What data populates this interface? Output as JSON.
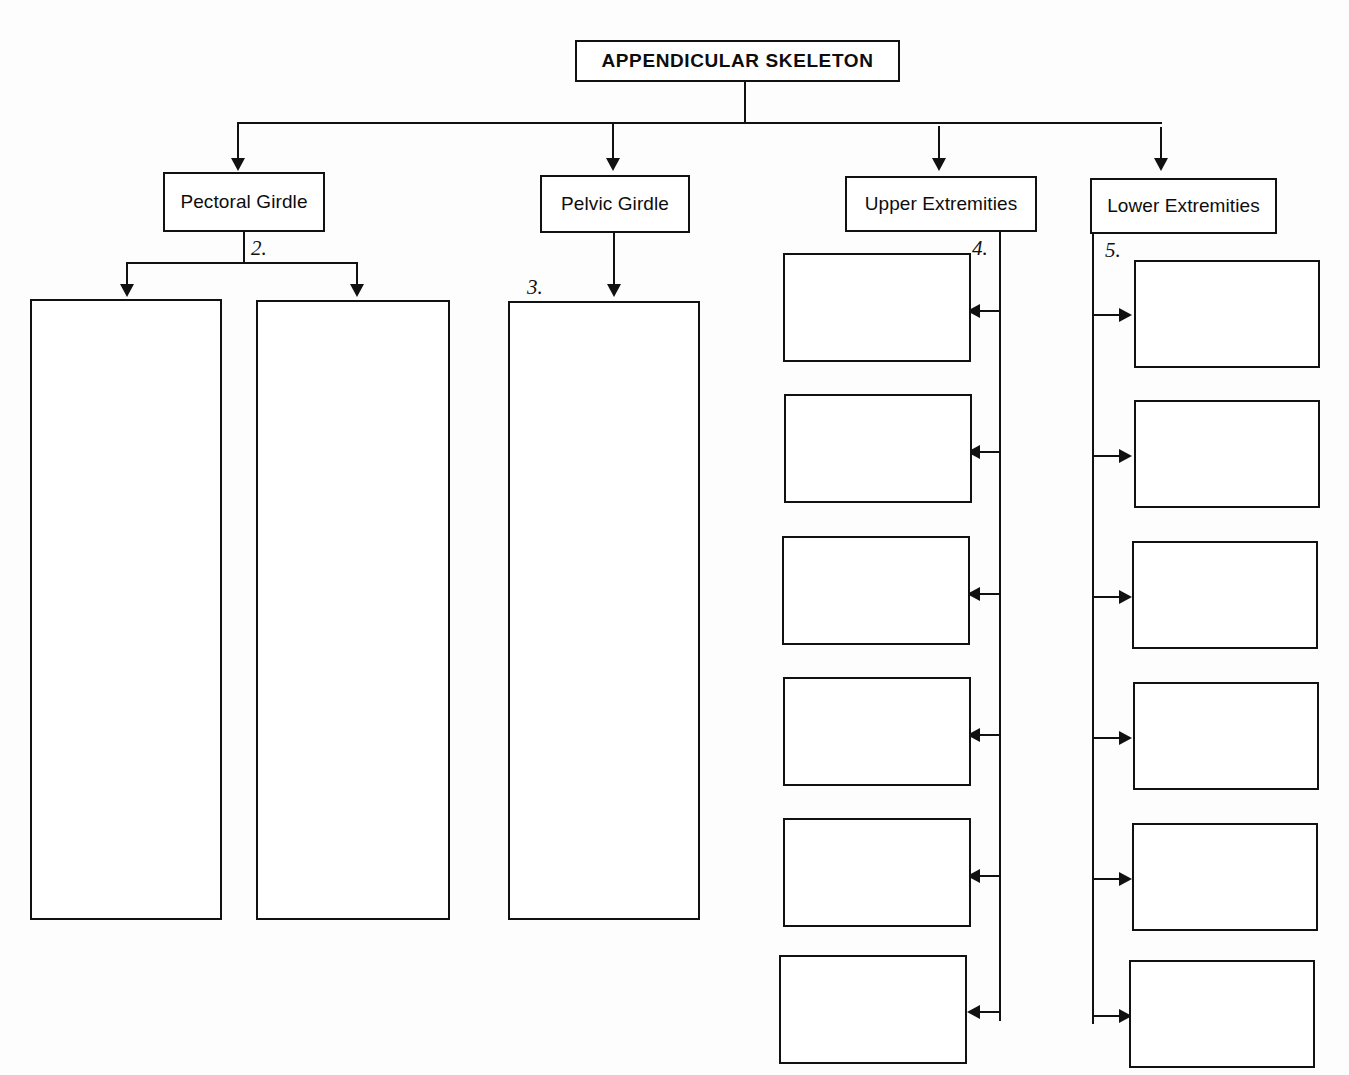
{
  "diagram": {
    "title_box": {
      "label": "APPENDICULAR SKELETON"
    },
    "branches": [
      {
        "id": "pectoral-girdle",
        "label": "Pectoral Girdle"
      },
      {
        "id": "pelvic-girdle",
        "label": "Pelvic Girdle"
      },
      {
        "id": "upper-extremities",
        "label": "Upper Extremities"
      },
      {
        "id": "lower-extremities",
        "label": "Lower Extremities"
      }
    ],
    "callouts": [
      {
        "id": "callout-2",
        "text": "2."
      },
      {
        "id": "callout-3",
        "text": "3."
      },
      {
        "id": "callout-4",
        "text": "4."
      },
      {
        "id": "callout-5",
        "text": "5."
      }
    ],
    "pectoral_blanks": [
      {
        "id": "pectoral-blank-1",
        "text": ""
      },
      {
        "id": "pectoral-blank-2",
        "text": ""
      }
    ],
    "pelvic_blanks": [
      {
        "id": "pelvic-blank-1",
        "text": ""
      }
    ],
    "upper_extremity_blanks": [
      {
        "id": "upper-blank-1",
        "text": ""
      },
      {
        "id": "upper-blank-2",
        "text": ""
      },
      {
        "id": "upper-blank-3",
        "text": ""
      },
      {
        "id": "upper-blank-4",
        "text": ""
      },
      {
        "id": "upper-blank-5",
        "text": ""
      },
      {
        "id": "upper-blank-6",
        "text": ""
      }
    ],
    "lower_extremity_blanks": [
      {
        "id": "lower-blank-1",
        "text": ""
      },
      {
        "id": "lower-blank-2",
        "text": ""
      },
      {
        "id": "lower-blank-3",
        "text": ""
      },
      {
        "id": "lower-blank-4",
        "text": ""
      },
      {
        "id": "lower-blank-5",
        "text": ""
      },
      {
        "id": "lower-blank-6",
        "text": ""
      }
    ],
    "colors": {
      "line": "#111111",
      "box_fill": "#ffffff",
      "text": "#0d0d0d",
      "page": "#fdfdfd"
    }
  }
}
